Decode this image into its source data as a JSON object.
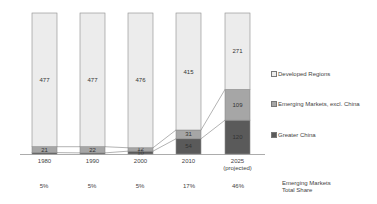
{
  "chart_data": {
    "type": "bar",
    "stacked": true,
    "title": "",
    "xlabel": "",
    "ylabel": "",
    "categories": [
      "1980",
      "1990",
      "2000",
      "2010",
      "2025 (projected)"
    ],
    "category_lines": [
      [
        "1980"
      ],
      [
        "1990"
      ],
      [
        "2000"
      ],
      [
        "2010"
      ],
      [
        "2025",
        "(projected)"
      ]
    ],
    "series": [
      {
        "name": "Greater China",
        "values": [
          5,
          4,
          10,
          54,
          120
        ],
        "labels": [
          "",
          "",
          "10",
          "54",
          "120"
        ],
        "color": "#5a5a5a"
      },
      {
        "name": "Emerging Markets, excl. China",
        "values": [
          21,
          22,
          12,
          31,
          109
        ],
        "labels": [
          "21",
          "22",
          "12",
          "31",
          "109"
        ],
        "color": "#a6a6a6"
      },
      {
        "name": "Developed Regions",
        "values": [
          477,
          477,
          476,
          415,
          271
        ],
        "labels": [
          "477",
          "477",
          "476",
          "415",
          "271"
        ],
        "color": "#ececec"
      }
    ],
    "legend": {
      "position": "right",
      "entries": [
        "Developed Regions",
        "Emerging Markets, excl. China",
        "Greater China"
      ]
    },
    "annotations": {
      "row_title": [
        "Emerging Markets",
        "Total Share"
      ],
      "emerging_markets_total_share": [
        "5%",
        "5%",
        "5%",
        "17%",
        "46%"
      ]
    },
    "grid": false,
    "connector_lines": true
  },
  "legend": {
    "developed": "Developed Regions",
    "emerging": "Emerging Markets, excl. China",
    "china": "Greater China"
  },
  "share_row": {
    "title_line1": "Emerging Markets",
    "title_line2": "Total Share",
    "values": [
      "5%",
      "5%",
      "5%",
      "17%",
      "46%"
    ]
  }
}
